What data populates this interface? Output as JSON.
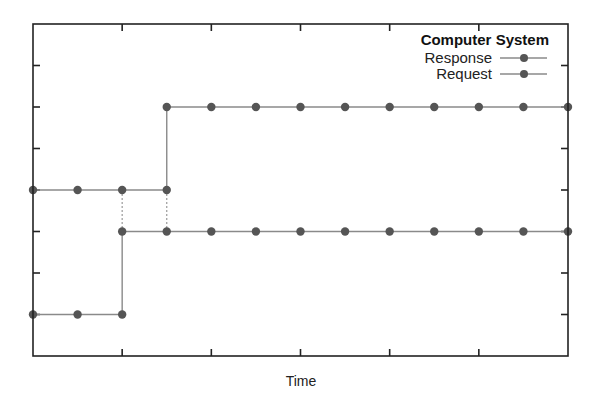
{
  "chart_data": {
    "type": "line",
    "title": "",
    "xlabel": "Time",
    "ylabel": "",
    "xlim": [
      0,
      12
    ],
    "ylim": [
      0,
      8
    ],
    "x_ticks": [
      2,
      4,
      6,
      8,
      10
    ],
    "y_ticks": [
      1,
      2,
      3,
      4,
      5,
      6,
      7
    ],
    "x_tick_labels": [],
    "y_tick_labels": [],
    "grid": false,
    "legend_title": "Computer System",
    "legend_position": "top-right",
    "series": [
      {
        "name": "Response",
        "style": "step",
        "points": [
          [
            0,
            4
          ],
          [
            1,
            4
          ],
          [
            2,
            4
          ],
          [
            3,
            4
          ],
          [
            3,
            6
          ],
          [
            4,
            6
          ],
          [
            5,
            6
          ],
          [
            6,
            6
          ],
          [
            7,
            6
          ],
          [
            8,
            6
          ],
          [
            9,
            6
          ],
          [
            10,
            6
          ],
          [
            11,
            6
          ],
          [
            12,
            6
          ]
        ]
      },
      {
        "name": "Request",
        "style": "step",
        "points": [
          [
            0,
            1
          ],
          [
            1,
            1
          ],
          [
            2,
            1
          ],
          [
            2,
            3
          ],
          [
            3,
            3
          ],
          [
            4,
            3
          ],
          [
            5,
            3
          ],
          [
            6,
            3
          ],
          [
            7,
            3
          ],
          [
            8,
            3
          ],
          [
            9,
            3
          ],
          [
            10,
            3
          ],
          [
            11,
            3
          ],
          [
            12,
            3
          ]
        ]
      }
    ],
    "connectors": [
      {
        "from": [
          2,
          4
        ],
        "to": [
          2,
          3
        ],
        "style": "dotted"
      },
      {
        "from": [
          3,
          4
        ],
        "to": [
          3,
          3
        ],
        "style": "dotted"
      }
    ]
  },
  "legend": {
    "title": "Computer System",
    "items": [
      {
        "label": "Response"
      },
      {
        "label": "Request"
      }
    ]
  },
  "axes": {
    "xlabel": "Time"
  }
}
